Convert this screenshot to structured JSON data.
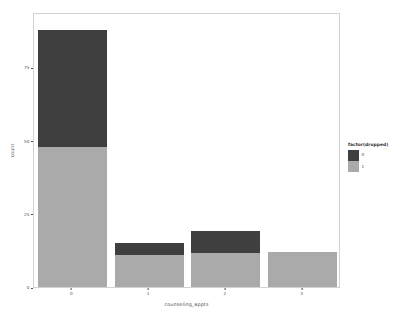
{
  "chart_data": {
    "type": "bar",
    "stacked": true,
    "title": "",
    "subtitle": "",
    "xlabel": "counseling_appts",
    "ylabel": "count",
    "categories": [
      "0",
      "1",
      "2",
      "3"
    ],
    "series": [
      {
        "name": "1",
        "color": "#aaaaaa",
        "values": [
          48,
          11,
          11.5,
          12
        ]
      },
      {
        "name": "0",
        "color": "#3f3f3f",
        "values": [
          40,
          4,
          7.5,
          0
        ]
      }
    ],
    "totals": [
      88,
      15,
      19,
      12
    ],
    "xlim": [
      -0.5,
      3.5
    ],
    "ylim": [
      0,
      94
    ],
    "yticks": [
      0,
      25,
      50,
      75
    ],
    "ytick_labels": [
      "0",
      "25",
      "50",
      "75"
    ],
    "xticks": [
      0,
      1,
      2,
      3
    ],
    "xtick_labels": [
      "0",
      "1",
      "2",
      "3"
    ],
    "grid": false,
    "legend": {
      "title": "factor(dropped)",
      "position": "right",
      "entries": [
        {
          "label": "0",
          "color": "#3f3f3f"
        },
        {
          "label": "1",
          "color": "#aaaaaa"
        }
      ]
    },
    "panel": {
      "background": "#ffffff",
      "border_color": "#d2d2d2"
    }
  }
}
